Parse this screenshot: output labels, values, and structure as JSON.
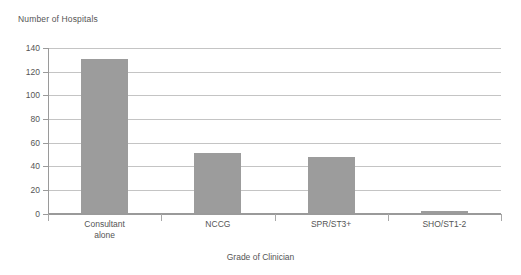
{
  "chart_data": {
    "type": "bar",
    "title": "",
    "ylabel": "Number of Hospitals",
    "xlabel": "Grade of Clinician",
    "categories": [
      "Consultant\nalone",
      "NCCG",
      "SPR/ST3+",
      "SHO/ST1-2"
    ],
    "values": [
      131,
      51,
      48,
      2
    ],
    "ylim": [
      0,
      140
    ],
    "yticks": [
      0,
      20,
      40,
      60,
      80,
      100,
      120,
      140
    ],
    "ytick_labels": [
      "0",
      "20",
      "40",
      "60",
      "80",
      "100",
      "120",
      "140"
    ],
    "grid": true,
    "legend": false,
    "bar_color": "#9c9c9c",
    "gridline_color": "#c4c4c4",
    "axis_color": "#9a9a9a",
    "text_color": "#555555",
    "background": "#ffffff"
  }
}
